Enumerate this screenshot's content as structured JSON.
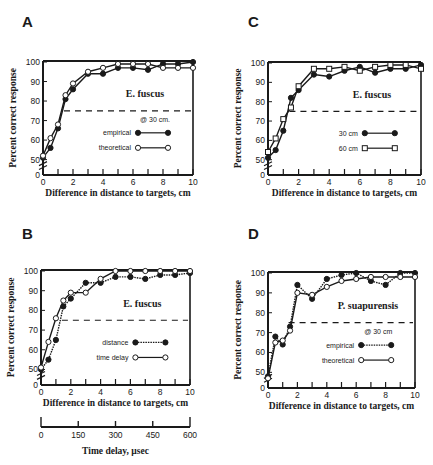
{
  "panels": {
    "A": {
      "letter": "A",
      "species": "E. fuscus",
      "legend_note": "@ 30 cm.",
      "legend": [
        "empirical",
        "theoretical"
      ]
    },
    "B": {
      "letter": "B",
      "species": "E. fuscus",
      "legend_note": "",
      "legend": [
        "distance",
        "time delay"
      ],
      "secondary_xlabel": "Time delay, µsec",
      "secondary_ticks": [
        "0",
        "150",
        "300",
        "450",
        "600"
      ]
    },
    "C": {
      "letter": "C",
      "species": "E. fuscus",
      "legend_note": "",
      "legend": [
        "30 cm",
        "60 cm"
      ]
    },
    "D": {
      "letter": "D",
      "species": "P. suapurensis",
      "legend_note": "@ 30 cm",
      "legend": [
        "empirical",
        "theoretical"
      ]
    }
  },
  "axes": {
    "xlabel": "Difference in distance to targets, cm",
    "ylabel": "Percent correct response",
    "xticks": [
      "0",
      "2",
      "4",
      "6",
      "8",
      "10"
    ],
    "yticks": [
      "0",
      "50",
      "60",
      "70",
      "80",
      "90",
      "100"
    ]
  },
  "colors": {
    "ink": "#1a1a1a",
    "background": "#ffffff"
  },
  "chart_data": [
    {
      "type": "line",
      "panel": "A",
      "title": "E. fuscus",
      "annotation": "@ 30 cm.",
      "xlabel": "Difference in distance to targets, cm",
      "ylabel": "Percent correct response",
      "xlim": [
        0,
        10
      ],
      "ylim": [
        45,
        100
      ],
      "y_axis_break": true,
      "reference_line": 75,
      "x": [
        0,
        0.5,
        1,
        1.5,
        2,
        3,
        4,
        5,
        6,
        7,
        8,
        9,
        10
      ],
      "series": [
        {
          "name": "empirical",
          "marker": "filled-circle",
          "line": "solid",
          "values": [
            51,
            56,
            66,
            81,
            86,
            94,
            94,
            97,
            97,
            96,
            99,
            99,
            100
          ]
        },
        {
          "name": "theoretical",
          "marker": "open-circle",
          "line": "solid",
          "values": [
            52,
            61,
            68,
            83,
            89,
            95,
            97,
            99,
            99,
            99,
            97,
            97,
            97
          ]
        }
      ],
      "legend_position": "lower right"
    },
    {
      "type": "line",
      "panel": "B",
      "title": "E. fuscus",
      "xlabel": "Difference in distance to targets, cm",
      "ylabel": "Percent correct response",
      "secondary_xlabel": "Time delay, µsec",
      "secondary_xticks": [
        0,
        150,
        300,
        450,
        600
      ],
      "xlim": [
        0,
        10
      ],
      "ylim": [
        45,
        100
      ],
      "y_axis_break": true,
      "reference_line": 75,
      "x": [
        0,
        0.5,
        1,
        1.5,
        2,
        3,
        4,
        5,
        6,
        7,
        8,
        9,
        10
      ],
      "series": [
        {
          "name": "distance",
          "marker": "filled-circle",
          "line": "dotted",
          "values": [
            50,
            55,
            65,
            82,
            86,
            94,
            94,
            97,
            97,
            96,
            98,
            98,
            99
          ]
        },
        {
          "name": "time delay",
          "marker": "open-circle",
          "line": "solid",
          "values": [
            51,
            64,
            76,
            85,
            89,
            89,
            96,
            100,
            100,
            100,
            100,
            100,
            100
          ]
        }
      ],
      "legend_position": "lower right"
    },
    {
      "type": "line",
      "panel": "C",
      "title": "E. fuscus",
      "xlabel": "Difference in distance to targets, cm",
      "ylabel": "Percent correct response",
      "xlim": [
        0,
        10
      ],
      "ylim": [
        45,
        100
      ],
      "y_axis_break": true,
      "reference_line": 75,
      "x": [
        0,
        0.5,
        1,
        1.5,
        2,
        3,
        4,
        5,
        6,
        7,
        8,
        9,
        10
      ],
      "series": [
        {
          "name": "30 cm",
          "marker": "filled-circle",
          "line": "solid",
          "values": [
            51,
            55,
            65,
            82,
            86,
            94,
            93,
            96,
            98,
            95,
            97,
            97,
            99
          ]
        },
        {
          "name": "60 cm",
          "marker": "open-square",
          "line": "solid",
          "values": [
            54,
            61,
            71,
            77,
            88,
            97,
            97,
            98,
            96,
            98,
            99,
            99,
            97
          ]
        }
      ],
      "legend_position": "lower right"
    },
    {
      "type": "line",
      "panel": "D",
      "title": "P. suapurensis",
      "annotation": "@ 30 cm",
      "xlabel": "Difference in distance to targets, cm",
      "ylabel": "Percent correct response",
      "xlim": [
        0,
        10
      ],
      "ylim": [
        45,
        100
      ],
      "y_axis_break": true,
      "reference_line": 75,
      "x": [
        0,
        0.5,
        1,
        1.5,
        2,
        3,
        4,
        5,
        6,
        7,
        8,
        9,
        10
      ],
      "series": [
        {
          "name": "empirical",
          "marker": "filled-circle",
          "line": "dotted",
          "values": [
            48,
            68,
            64,
            73,
            94,
            87,
            97,
            99,
            100,
            96,
            94,
            100,
            100
          ]
        },
        {
          "name": "theoretical",
          "marker": "open-circle",
          "line": "solid",
          "values": [
            47,
            65,
            66,
            71,
            90,
            89,
            93,
            96,
            97,
            98,
            98,
            98,
            98
          ]
        }
      ],
      "legend_position": "lower right"
    }
  ]
}
